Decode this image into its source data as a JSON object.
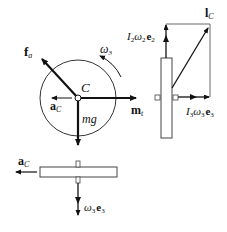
{
  "diagram": {
    "labels": {
      "fa": "f",
      "fa_sub": "a",
      "omega3": "ω",
      "omega3_sub": "3",
      "center": "C",
      "aC": "a",
      "aC_sub": "C",
      "mt": "m",
      "mt_sub": "t",
      "mg": "mg",
      "lC": "l",
      "lC_sub": "C",
      "I2w2e2_I": "I",
      "I2w2e2_Isub": "2",
      "I2w2e2_w": "ω",
      "I2w2e2_wsub": "2",
      "I2w2e2_e": "e",
      "I2w2e2_esub": "2",
      "I3w3e3_I": "I",
      "I3w3e3_Isub": "3",
      "I3w3e3_w": "ω",
      "I3w3e3_wsub": "3",
      "I3w3e3_e": "e",
      "I3w3e3_esub": "3",
      "bottom_aC": "a",
      "bottom_aC_sub": "C",
      "w3e3_w": "ω",
      "w3e3_wsub": "3",
      "w3e3_e": "e",
      "w3e3_esub": "3"
    },
    "colors": {
      "stroke": "#111111",
      "light": "#444444",
      "background": "#ffffff"
    }
  }
}
